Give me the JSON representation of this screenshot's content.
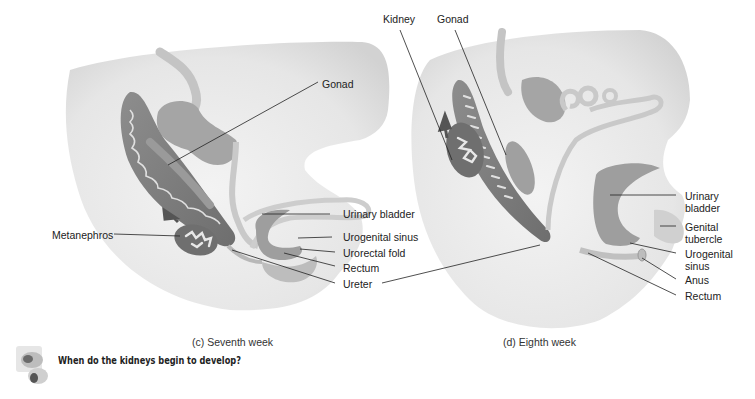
{
  "panels": [
    {
      "id": "c",
      "caption": "(c) Seventh week",
      "labels": {
        "gonad": "Gonad",
        "metanephros": "Metanephros",
        "urinary_bladder": "Urinary bladder",
        "urogenital_sinus": "Urogenital sinus",
        "urorectal_fold": "Urorectal fold",
        "rectum": "Rectum",
        "ureter": "Ureter"
      }
    },
    {
      "id": "d",
      "caption": "(d) Eighth week",
      "labels": {
        "kidney": "Kidney",
        "gonad": "Gonad",
        "urinary_bladder_1": "Urinary",
        "urinary_bladder_2": "bladder",
        "genital_tubercle_1": "Genital",
        "genital_tubercle_2": "tubercle",
        "urogenital_sinus_1": "Urogenital",
        "urogenital_sinus_2": "sinus",
        "anus": "Anus",
        "rectum": "Rectum"
      }
    }
  ],
  "question": {
    "icon": "question-blocks-icon",
    "text": "When do the kidneys begin to develop?"
  },
  "colors": {
    "body_light": "#ececec",
    "body_mid": "#d8d8d8",
    "organ_dark": "#7c7c7c",
    "organ_mid": "#a9a9a9",
    "duct": "#c8c8c8",
    "leader": "#222222"
  }
}
